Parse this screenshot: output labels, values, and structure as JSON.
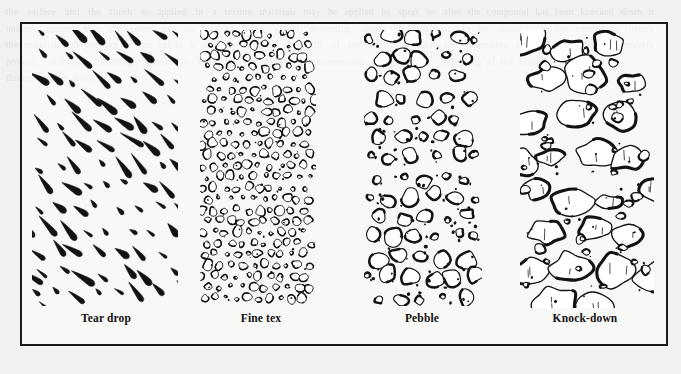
{
  "figure": {
    "kind": "texture-sample-plate",
    "border_color": "#1a1a1a",
    "background_color": "#f2f1ef",
    "ink_color": "#111111",
    "panel_count": 4
  },
  "panels": [
    {
      "id": "teardrop",
      "label": "Tear drop",
      "pattern": "teardrop",
      "description": "elongated comma / teardrop strokes angled toward the lower left"
    },
    {
      "id": "finetex",
      "label": "Fine tex",
      "pattern": "fine-texture",
      "description": "dense field of very small irregular rounded blob outlines with fine speckles"
    },
    {
      "id": "pebble",
      "label": "Pebble",
      "pattern": "pebble",
      "description": "medium irregular stones with shaded lower edges and scattered dots"
    },
    {
      "id": "knockdown",
      "label": "Knock-down",
      "pattern": "knock-down",
      "description": "large flattened splotches with heavy lower contours and short interior tick marks"
    }
  ],
  "ghost_text": {
    "column1": "the surface and the finish is applied in a uniform manner over the entire area so that the material will not sag or run before it sets properly and the resulting pattern is even throughout the work",
    "column2": "texture materials may be applied by spray or by hand trowel depending upon the effect desired and the skill of the applicator each method produces a characteristic appearance",
    "column3": "after the compound has been knocked down it should be allowed to dry completely before any decorative coating is applied to prevent blistering of the finish"
  }
}
